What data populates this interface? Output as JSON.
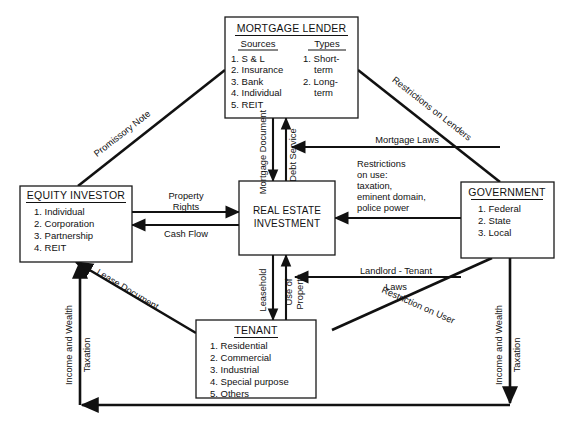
{
  "diagram": {
    "line_color": "#111111",
    "box_fill": "#ffffff",
    "nodes": {
      "mortgage_lender": {
        "title": "MORTGAGE LENDER",
        "col1_header": "Sources",
        "col2_header": "Types",
        "sources": [
          "1. S & L",
          "2. Insurance",
          "3. Bank",
          "4. Individual",
          "5. REIT"
        ],
        "types": [
          "1. Short-",
          "term",
          "2. Long-",
          "term"
        ]
      },
      "equity_investor": {
        "title": "EQUITY INVESTOR",
        "items": [
          "1. Individual",
          "2. Corporation",
          "3. Partnership",
          "4. REIT"
        ]
      },
      "real_estate_investment": {
        "title_line1": "REAL ESTATE",
        "title_line2": "INVESTMENT"
      },
      "government": {
        "title": "GOVERNMENT",
        "items": [
          "1. Federal",
          "2. State",
          "3. Local"
        ]
      },
      "tenant": {
        "title": "TENANT",
        "items": [
          "1. Residential",
          "2. Commercial",
          "3. Industrial",
          "4. Special purpose",
          "5. Others"
        ]
      }
    },
    "edges": {
      "promissory_note": "Promissory Note",
      "restrictions_on_lenders": "Restrictions on Lenders",
      "mortgage_document": "Mortgage Document",
      "debt_service": "Debt Service",
      "mortgage_laws": "Mortgage Laws",
      "restrictions_on_use": [
        "Restrictions",
        "on use:",
        "taxation,",
        "eminent domain,",
        "police power"
      ],
      "property_rights_line1": "Property",
      "property_rights_line2": "Rights",
      "cash_flow": "Cash Flow",
      "leasehold": "Leasehold",
      "use_of_property_line1": "Use of",
      "use_of_property_line2": "Property",
      "landlord_tenant_line1": "Landlord - Tenant",
      "landlord_tenant_line2": "Laws",
      "restriction_on_user": "Restriction on User",
      "lease_document": "Lease Document",
      "income_and_wealth_left": "Income and Wealth",
      "taxation_left": "Taxation",
      "income_and_wealth_right": "Income and Wealth",
      "taxation_right": "Taxation"
    }
  }
}
